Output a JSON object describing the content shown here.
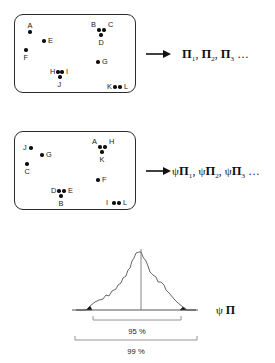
{
  "figure": {
    "background_color": "#ffffff",
    "ink_color": "#111111"
  },
  "rows": [
    {
      "id": "resample-1",
      "box": {
        "x": 14,
        "y": 14,
        "width": 122,
        "height": 79
      },
      "points": [
        {
          "label": "A",
          "x": 30,
          "y": 32,
          "label_pos": "above"
        },
        {
          "label": "E",
          "x": 44,
          "y": 41,
          "label_pos": "right"
        },
        {
          "label": "F",
          "x": 26,
          "y": 50,
          "label_pos": "below"
        },
        {
          "label": "B",
          "x": 99,
          "y": 30,
          "label_pos": "upper-left"
        },
        {
          "label": "C",
          "x": 104,
          "y": 30,
          "label_pos": "upper-right"
        },
        {
          "label": "D",
          "x": 101,
          "y": 35,
          "label_pos": "below"
        },
        {
          "label": "G",
          "x": 98,
          "y": 62,
          "label_pos": "right"
        },
        {
          "label": "H",
          "x": 58,
          "y": 72,
          "label_pos": "left"
        },
        {
          "label": "I",
          "x": 62,
          "y": 72,
          "label_pos": "right"
        },
        {
          "label": "J",
          "x": 60,
          "y": 77,
          "label_pos": "below"
        },
        {
          "label": "K",
          "x": 115,
          "y": 87,
          "label_pos": "left"
        },
        {
          "label": "L",
          "x": 120,
          "y": 87,
          "label_pos": "right"
        }
      ],
      "arrow": {
        "x": 146,
        "y": 54,
        "length": 22
      },
      "formula": {
        "x": 182,
        "y": 47,
        "parts": [
          {
            "symbol": "Π",
            "sub": "1"
          },
          {
            "symbol": "Π",
            "sub": "2"
          },
          {
            "symbol": "Π",
            "sub": "3"
          }
        ],
        "separator": ",",
        "ellipsis": "…",
        "text": "Π₁, Π₂, Π₃ …"
      }
    },
    {
      "id": "resample-2",
      "box": {
        "x": 14,
        "y": 131,
        "width": 122,
        "height": 79
      },
      "points": [
        {
          "label": "J",
          "x": 31,
          "y": 148,
          "label_pos": "left"
        },
        {
          "label": "G",
          "x": 42,
          "y": 155,
          "label_pos": "right"
        },
        {
          "label": "C",
          "x": 27,
          "y": 164,
          "label_pos": "below"
        },
        {
          "label": "A",
          "x": 100,
          "y": 147,
          "label_pos": "upper-left"
        },
        {
          "label": "H",
          "x": 105,
          "y": 147,
          "label_pos": "upper-right"
        },
        {
          "label": "K",
          "x": 102,
          "y": 152,
          "label_pos": "below"
        },
        {
          "label": "F",
          "x": 98,
          "y": 180,
          "label_pos": "right"
        },
        {
          "label": "D",
          "x": 59,
          "y": 191,
          "label_pos": "left"
        },
        {
          "label": "E",
          "x": 64,
          "y": 191,
          "label_pos": "right"
        },
        {
          "label": "B",
          "x": 61,
          "y": 196,
          "label_pos": "below"
        },
        {
          "label": "I",
          "x": 114,
          "y": 203,
          "label_pos": "left"
        },
        {
          "label": "L",
          "x": 119,
          "y": 203,
          "label_pos": "right"
        }
      ],
      "arrow": {
        "x": 146,
        "y": 171,
        "length": 22
      },
      "formula": {
        "x": 172,
        "y": 164,
        "parts": [
          {
            "symbol": "ψΠ",
            "sub": "1"
          },
          {
            "symbol": "ψΠ",
            "sub": "2"
          },
          {
            "symbol": "ψΠ",
            "sub": "3"
          }
        ],
        "separator": ",",
        "ellipsis": "…",
        "text": "ψ Π₁, ψΠ₂, ψΠ₃ …"
      }
    }
  ],
  "distribution": {
    "id": "bootstrap-distribution",
    "axis": {
      "x1": 72,
      "x2": 198,
      "y": 310
    },
    "center_line": {
      "x": 141,
      "y_top": 249,
      "y_bottom": 310
    },
    "baseline_y": 310,
    "peak": {
      "x": 141,
      "y": 252
    },
    "curve_points": [
      [
        86,
        310
      ],
      [
        90,
        306
      ],
      [
        95,
        302
      ],
      [
        99,
        300
      ],
      [
        103,
        299
      ],
      [
        106,
        295
      ],
      [
        109,
        296
      ],
      [
        112,
        291
      ],
      [
        116,
        289
      ],
      [
        118,
        285
      ],
      [
        121,
        283
      ],
      [
        123,
        278
      ],
      [
        126,
        276
      ],
      [
        128,
        270
      ],
      [
        130,
        268
      ],
      [
        132,
        261
      ],
      [
        134,
        258
      ],
      [
        136,
        253
      ],
      [
        139,
        252
      ],
      [
        141,
        252
      ],
      [
        143,
        257
      ],
      [
        146,
        261
      ],
      [
        148,
        266
      ],
      [
        150,
        272
      ],
      [
        153,
        275
      ],
      [
        156,
        277
      ],
      [
        158,
        282
      ],
      [
        161,
        282
      ],
      [
        164,
        285
      ],
      [
        166,
        290
      ],
      [
        170,
        294
      ],
      [
        174,
        299
      ],
      [
        178,
        303
      ],
      [
        183,
        307
      ],
      [
        187,
        310
      ]
    ],
    "tails": {
      "left": {
        "from": 76,
        "to": 92,
        "fill": "#111111"
      },
      "right": {
        "from": 180,
        "to": 196,
        "fill": "#111111"
      }
    },
    "brackets": [
      {
        "label": "95 %",
        "x1": 93,
        "x2": 181,
        "y": 320,
        "label_x": 137,
        "label_y": 327
      },
      {
        "label": "99 %",
        "x1": 75,
        "x2": 197,
        "y": 340,
        "label_x": 136,
        "label_y": 347
      }
    ],
    "axis_label": {
      "text": "ψ Π",
      "x": 216,
      "y": 303
    }
  }
}
